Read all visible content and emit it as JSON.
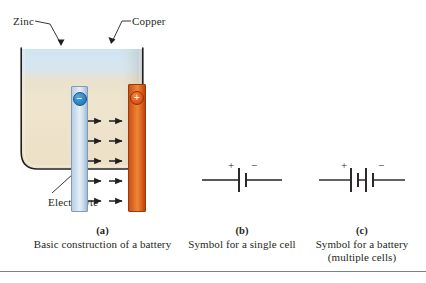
{
  "figure": {
    "panels": [
      {
        "id": "a",
        "tag": "(a)",
        "caption_line1": "Basic construction of a battery",
        "caption_line2": "",
        "labels": {
          "left_electrode": "Zinc",
          "right_electrode": "Copper",
          "medium": "Electrolyte"
        },
        "terminals": {
          "negative": "−",
          "positive": "+"
        },
        "arrow_rows": 5,
        "arrows_per_row": 2,
        "colors": {
          "zinc_electrode": "#cfe0ef",
          "copper_electrode": "#de6a22",
          "electrolyte": "#efe3c9",
          "liquid_top": "#cfe3f0",
          "container_outline": "#231f20",
          "negative_terminal": "#2f86c8",
          "positive_terminal": "#de5d19"
        }
      },
      {
        "id": "b",
        "tag": "(b)",
        "caption_line1": "Symbol for a single cell",
        "caption_line2": "",
        "symbol": {
          "type": "single-cell",
          "plus_sign": "+",
          "minus_sign": "−",
          "plate_pairs": 1
        }
      },
      {
        "id": "c",
        "tag": "(c)",
        "caption_line1": "Symbol for a battery",
        "caption_line2": "(multiple cells)",
        "symbol": {
          "type": "multi-cell-battery",
          "plus_sign": "+",
          "minus_sign": "−",
          "plate_pairs": 2
        }
      }
    ]
  }
}
